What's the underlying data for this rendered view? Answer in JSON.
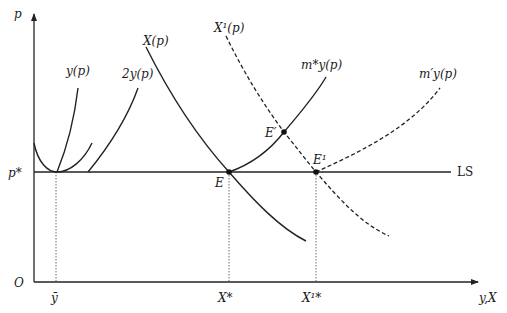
{
  "diagram": {
    "axes": {
      "y_label": "p",
      "x_label": "y,X",
      "origin_label": "O",
      "price_tick_label": "p*",
      "x_tick_labels": [
        "ȳ",
        "X*",
        "X¹*"
      ]
    },
    "curve_labels": {
      "firm_supply": "y(p)",
      "two_firm_supply": "2y(p)",
      "demand": "X(p)",
      "demand_shifted": "X¹(p)",
      "m_star_supply": "m*y(p)",
      "m_prime_supply": "m′y(p)",
      "long_run_supply": "LS"
    },
    "points": {
      "equilibrium": "E",
      "short_run_equilibrium": "E′",
      "new_equilibrium": "E¹"
    },
    "colors": {
      "ink": "#222222",
      "background": "#ffffff"
    }
  }
}
